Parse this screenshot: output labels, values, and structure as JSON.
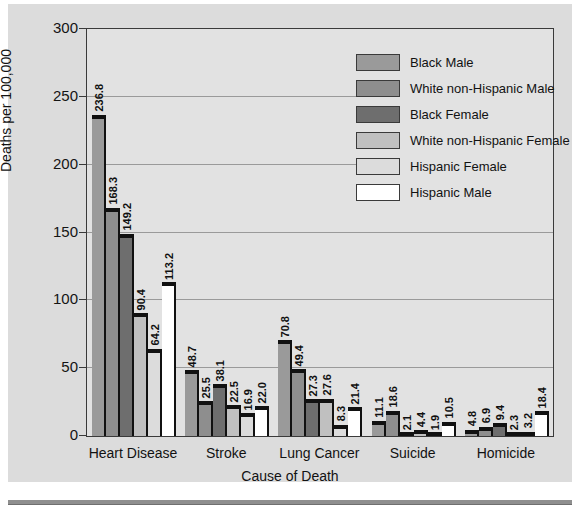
{
  "chart_data": {
    "type": "bar",
    "title": "",
    "xlabel": "Cause of Death",
    "ylabel": "Deaths per 100,000",
    "ylim": [
      0,
      300
    ],
    "yticks": [
      0,
      50,
      100,
      150,
      200,
      250,
      300
    ],
    "ytick_labels": [
      "0",
      "50",
      "100",
      "150",
      "200",
      "250",
      "300"
    ],
    "grid": true,
    "legend_position": "top-right",
    "categories": [
      "Heart Disease",
      "Stroke",
      "Lung Cancer",
      "Suicide",
      "Homicide"
    ],
    "series": [
      {
        "name": "Black Male",
        "color": "#9a9a9a",
        "values": [
          236.8,
          48.7,
          70.8,
          11.1,
          4.8
        ],
        "labels": [
          "236.8",
          "48.7",
          "70.8",
          "11.1",
          "4.8"
        ]
      },
      {
        "name": "White non-Hispanic Male",
        "color": "#8e8e8e",
        "values": [
          168.3,
          25.5,
          49.4,
          18.6,
          6.9
        ],
        "labels": [
          "168.3",
          "25.5",
          "49.4",
          "18.6",
          "6.9"
        ]
      },
      {
        "name": "Black Female",
        "color": "#6e6e6e",
        "values": [
          149.2,
          38.1,
          27.3,
          2.1,
          9.4
        ],
        "labels": [
          "149.2",
          "38.1",
          "27.3",
          "2.1",
          "9.4"
        ]
      },
      {
        "name": "White non-Hispanic Female",
        "color": "#c0c0c0",
        "values": [
          90.4,
          22.5,
          27.6,
          4.4,
          2.3
        ],
        "labels": [
          "90.4",
          "22.5",
          "27.6",
          "4.4",
          "2.3"
        ]
      },
      {
        "name": "Hispanic Female",
        "color": "#dcdcdc",
        "values": [
          64.2,
          16.9,
          8.3,
          1.9,
          3.2
        ],
        "labels": [
          "64.2",
          "16.9",
          "8.3",
          "1.9",
          "3.2"
        ]
      },
      {
        "name": "Hispanic Male",
        "color": "#ffffff",
        "values": [
          113.2,
          22.0,
          21.4,
          10.5,
          18.4
        ],
        "labels": [
          "113.2",
          "22.0",
          "21.4",
          "10.5",
          "18.4"
        ]
      }
    ]
  },
  "legend": {
    "items": [
      {
        "label": "Black Male",
        "color": "#9a9a9a"
      },
      {
        "label": "White non-Hispanic Male",
        "color": "#8e8e8e"
      },
      {
        "label": "Black Female",
        "color": "#6e6e6e"
      },
      {
        "label": "White non-Hispanic Female",
        "color": "#c0c0c0"
      },
      {
        "label": "Hispanic Female",
        "color": "#dcdcdc"
      },
      {
        "label": "Hispanic Male",
        "color": "#ffffff"
      }
    ]
  },
  "colors": {
    "panel_background": "#dcdcdc",
    "plot_background": "#e2e2e2",
    "gridline": "#9a9a9a",
    "axis": "#3a3a3a",
    "bar_edge": "#111111",
    "rule": "#8f8f8f"
  }
}
